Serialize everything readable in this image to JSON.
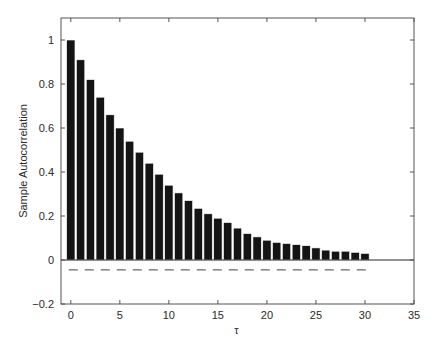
{
  "chart_data": {
    "type": "bar",
    "title": "",
    "xlabel": "τ",
    "ylabel": "Sample Autocorrelation",
    "xlim": [
      -1,
      35
    ],
    "ylim": [
      -0.2,
      1.1
    ],
    "x_ticks": [
      0,
      5,
      10,
      15,
      20,
      25,
      30,
      35
    ],
    "x_tick_labels": [
      "0",
      "5",
      "10",
      "15",
      "20",
      "25",
      "30",
      "35"
    ],
    "y_ticks": [
      -0.2,
      0,
      0.2,
      0.4,
      0.6,
      0.8,
      1
    ],
    "y_tick_labels": [
      "-0.2",
      "0",
      "0.2",
      "0.4",
      "0.6",
      "0.8",
      "1"
    ],
    "grid": false,
    "legend": null,
    "x": [
      0,
      1,
      2,
      3,
      4,
      5,
      6,
      7,
      8,
      9,
      10,
      11,
      12,
      13,
      14,
      15,
      16,
      17,
      18,
      19,
      20,
      21,
      22,
      23,
      24,
      25,
      26,
      27,
      28,
      29,
      30
    ],
    "values": [
      1.0,
      0.91,
      0.82,
      0.74,
      0.66,
      0.6,
      0.54,
      0.49,
      0.44,
      0.39,
      0.34,
      0.305,
      0.27,
      0.235,
      0.21,
      0.19,
      0.17,
      0.145,
      0.12,
      0.105,
      0.09,
      0.08,
      0.075,
      0.07,
      0.065,
      0.055,
      0.045,
      0.04,
      0.04,
      0.035,
      0.03
    ],
    "reference_lines": [
      {
        "name": "zero-line",
        "y": 0,
        "style": "solid",
        "x_range": [
          -1,
          35
        ]
      },
      {
        "name": "confidence-bound",
        "y": -0.045,
        "style": "dashed",
        "x_range": [
          0,
          30
        ]
      }
    ],
    "colors": {
      "bar": "#141414",
      "bar_edge": "#ffffff",
      "axis": "#555555",
      "text": "#2a2a2a",
      "dashed": "#444444"
    }
  }
}
